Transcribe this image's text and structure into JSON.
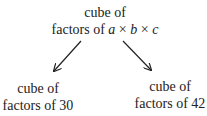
{
  "diagram": {
    "type": "tree",
    "root": {
      "line1": "cube of",
      "line2_prefix": "factors of ",
      "var_a": "a",
      "times1": " × ",
      "var_b": "b",
      "times2": " × ",
      "var_c": "c"
    },
    "children": [
      {
        "line1": "cube of",
        "line2": "factors of 30"
      },
      {
        "line1": "cube of",
        "line2": "factors of 42"
      }
    ],
    "edges": [
      {
        "from": "root",
        "to": "children.0"
      },
      {
        "from": "root",
        "to": "children.1"
      }
    ],
    "colors": {
      "text": "#222222",
      "arrow": "#222222",
      "background": "#ffffff"
    }
  }
}
